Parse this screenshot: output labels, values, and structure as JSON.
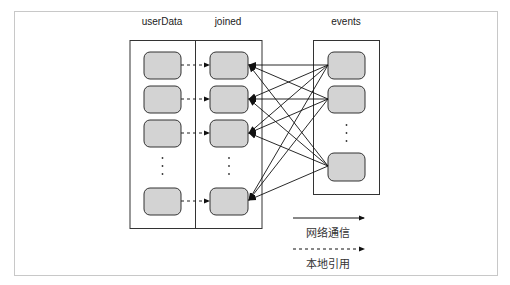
{
  "diagram": {
    "columns": [
      {
        "name": "userData",
        "label": "userData"
      },
      {
        "name": "joined",
        "label": "joined"
      },
      {
        "name": "events",
        "label": "events"
      }
    ],
    "legend": {
      "network": "网络通信",
      "local": "本地引用"
    },
    "colors": {
      "node_fill": "#d3d3d3",
      "stroke": "#222222",
      "frame": "#c8c8c8"
    }
  }
}
